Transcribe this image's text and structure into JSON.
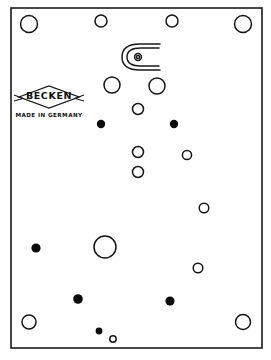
{
  "image": {
    "kind": "line-drawing",
    "subject": "haberdashery card of snap fasteners / press studs",
    "width": 271,
    "height": 360,
    "background_color": "#ffffff",
    "ink_color": "#1a1a1a"
  },
  "card": {
    "frame": {
      "x": 11,
      "y": 8,
      "width": 251,
      "height": 340
    },
    "border_color": "#1a1a1a"
  },
  "logo": {
    "brand": "BECKEN",
    "origin": "MADE IN GERMANY",
    "shape": "diamond",
    "center_x": 49,
    "center_y": 97,
    "diamond_half_width": 30,
    "diamond_half_height": 11,
    "brand_y": 99,
    "origin_y": 117,
    "text_color": "#101010"
  },
  "clasp": {
    "label": "hook-and-eye clasp illustration",
    "center_x": 146,
    "center_y": 57,
    "eye_x": 138,
    "eye_y": 57,
    "eye_radius": 3.4
  },
  "fasteners": {
    "legend": {
      "open": "open ring (socket side)",
      "filled": "filled dot (stud side)"
    },
    "open_rings": [
      {
        "cx": 29,
        "cy": 24,
        "r": 8.5,
        "name": "ring-top-left-corner"
      },
      {
        "cx": 101,
        "cy": 21,
        "r": 6.0,
        "name": "ring-top-second"
      },
      {
        "cx": 172,
        "cy": 21,
        "r": 6.0,
        "name": "ring-top-third"
      },
      {
        "cx": 243,
        "cy": 24,
        "r": 8.5,
        "name": "ring-top-right-corner"
      },
      {
        "cx": 112,
        "cy": 85,
        "r": 8.0,
        "name": "ring-upper-left-mid"
      },
      {
        "cx": 157,
        "cy": 86,
        "r": 8.0,
        "name": "ring-upper-right-mid"
      },
      {
        "cx": 138,
        "cy": 109,
        "r": 5.5,
        "name": "ring-center-upper"
      },
      {
        "cx": 138,
        "cy": 152,
        "r": 5.5,
        "name": "ring-center-lower"
      },
      {
        "cx": 138,
        "cy": 172,
        "r": 5.5,
        "name": "ring-center-bottom"
      },
      {
        "cx": 187,
        "cy": 155,
        "r": 4.6,
        "name": "ring-right-upper"
      },
      {
        "cx": 204,
        "cy": 208,
        "r": 4.8,
        "name": "ring-right-mid"
      },
      {
        "cx": 198,
        "cy": 268,
        "r": 4.8,
        "name": "ring-right-lower"
      },
      {
        "cx": 105,
        "cy": 247,
        "r": 11.0,
        "name": "ring-center-large"
      },
      {
        "cx": 29,
        "cy": 322,
        "r": 7.0,
        "name": "ring-bottom-left-corner"
      },
      {
        "cx": 243,
        "cy": 322,
        "r": 7.5,
        "name": "ring-bottom-right-corner"
      },
      {
        "cx": 113,
        "cy": 339,
        "r": 3.2,
        "name": "ring-bottom-tiny"
      }
    ],
    "filled_dots": [
      {
        "cx": 101,
        "cy": 124,
        "r": 4.2,
        "name": "dot-upper-left"
      },
      {
        "cx": 174,
        "cy": 124,
        "r": 4.2,
        "name": "dot-upper-right"
      },
      {
        "cx": 36,
        "cy": 248,
        "r": 4.6,
        "name": "dot-left-mid"
      },
      {
        "cx": 78,
        "cy": 299,
        "r": 4.8,
        "name": "dot-lower-left"
      },
      {
        "cx": 170,
        "cy": 301,
        "r": 4.6,
        "name": "dot-lower-right"
      },
      {
        "cx": 99,
        "cy": 331,
        "r": 3.4,
        "name": "dot-bottom-small"
      }
    ],
    "counts": {
      "open_rings": 16,
      "filled_dots": 6,
      "total": 22
    }
  }
}
